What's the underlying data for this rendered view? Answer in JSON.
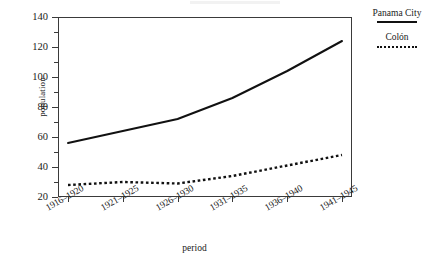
{
  "chart_data": {
    "type": "line",
    "title": "",
    "xlabel": "period",
    "ylabel": "population",
    "categories": [
      "1916–1920",
      "1921–1925",
      "1926–1930",
      "1931–1935",
      "1936–1940",
      "1941–1945"
    ],
    "ylim": [
      20,
      140
    ],
    "ytick_values": [
      20,
      40,
      60,
      80,
      100,
      120,
      140
    ],
    "ytick_labels": [
      "20",
      "40",
      "60",
      "80",
      "100",
      "120",
      "140"
    ],
    "yminor_values": [
      30,
      50,
      70,
      90,
      110,
      130
    ],
    "grid": false,
    "legend_position": "right",
    "series": [
      {
        "name": "Panama City",
        "style": "solid",
        "color": "#111111",
        "values": [
          56,
          64,
          72,
          86,
          104,
          124
        ]
      },
      {
        "name": "Colón",
        "style": "dashed",
        "color": "#111111",
        "values": [
          28,
          30,
          29,
          34,
          41,
          48
        ]
      }
    ]
  },
  "legend": {
    "entries": [
      {
        "label": "Panama City",
        "style": "solid"
      },
      {
        "label": "Colón",
        "style": "dashed"
      }
    ]
  },
  "axes": {
    "y_title": "population",
    "x_title": "period"
  }
}
